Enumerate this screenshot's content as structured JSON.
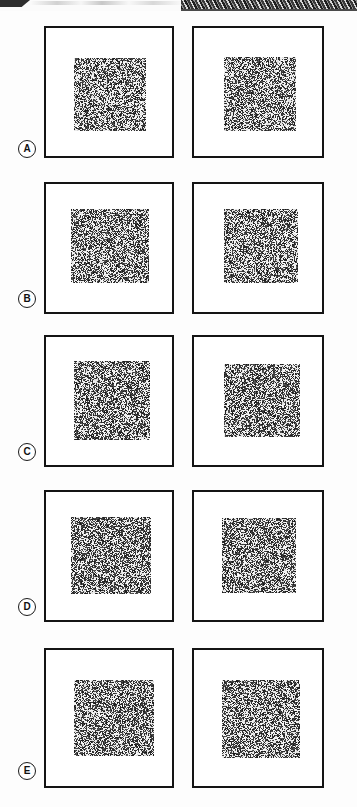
{
  "figure": {
    "width_px": 357,
    "height_px": 807,
    "background_color": "#fdfdfd",
    "panel_border_color": "#141414",
    "label_text_color": "#111111",
    "noise_dark_color": "#151515",
    "noise_light_color": "#ffffff",
    "columns": 2,
    "rows_count": 5
  },
  "scan_artifact": {
    "present": true,
    "description": "dark scan edge strip across top of page",
    "left_block_color": "#2e2e2e",
    "hatch_color": "#1f1f1f",
    "height_px": 11
  },
  "rows": [
    {
      "label": "A",
      "label_top": 140,
      "row_top": 24,
      "row_height": 136,
      "panels": [
        {
          "name": "panel-a-left",
          "left": 44,
          "top": 26,
          "width": 130,
          "height": 132,
          "patch": {
            "left": 28,
            "top": 30,
            "width": 72,
            "height": 73,
            "density": 0.5,
            "seed": 11
          }
        },
        {
          "name": "panel-a-right",
          "left": 192,
          "top": 26,
          "width": 132,
          "height": 132,
          "patch": {
            "left": 30,
            "top": 29,
            "width": 72,
            "height": 74,
            "density": 0.5,
            "seed": 12
          }
        }
      ]
    },
    {
      "label": "B",
      "label_top": 290,
      "row_top": 182,
      "row_height": 132,
      "panels": [
        {
          "name": "panel-b-left",
          "left": 44,
          "top": 182,
          "width": 130,
          "height": 132,
          "patch": {
            "left": 25,
            "top": 25,
            "width": 78,
            "height": 74,
            "density": 0.52,
            "seed": 21
          }
        },
        {
          "name": "panel-b-right",
          "left": 192,
          "top": 182,
          "width": 132,
          "height": 132,
          "patch": {
            "left": 30,
            "top": 25,
            "width": 74,
            "height": 74,
            "density": 0.52,
            "seed": 22
          }
        }
      ]
    },
    {
      "label": "C",
      "label_top": 443,
      "row_top": 335,
      "row_height": 132,
      "panels": [
        {
          "name": "panel-c-left",
          "left": 44,
          "top": 335,
          "width": 130,
          "height": 132,
          "patch": {
            "left": 28,
            "top": 24,
            "width": 76,
            "height": 79,
            "density": 0.54,
            "seed": 31
          }
        },
        {
          "name": "panel-c-right",
          "left": 192,
          "top": 335,
          "width": 132,
          "height": 132,
          "patch": {
            "left": 30,
            "top": 27,
            "width": 76,
            "height": 73,
            "density": 0.54,
            "seed": 32
          }
        }
      ]
    },
    {
      "label": "D",
      "label_top": 598,
      "row_top": 490,
      "row_height": 132,
      "panels": [
        {
          "name": "panel-d-left",
          "left": 44,
          "top": 490,
          "width": 130,
          "height": 132,
          "patch": {
            "left": 25,
            "top": 25,
            "width": 80,
            "height": 77,
            "density": 0.55,
            "seed": 41
          }
        },
        {
          "name": "panel-d-right",
          "left": 192,
          "top": 490,
          "width": 132,
          "height": 132,
          "patch": {
            "left": 28,
            "top": 26,
            "width": 74,
            "height": 75,
            "density": 0.55,
            "seed": 42
          }
        }
      ]
    },
    {
      "label": "E",
      "label_top": 762,
      "row_top": 648,
      "row_height": 140,
      "panels": [
        {
          "name": "panel-e-left",
          "left": 44,
          "top": 648,
          "width": 130,
          "height": 140,
          "patch": {
            "left": 28,
            "top": 30,
            "width": 80,
            "height": 76,
            "density": 0.53,
            "seed": 51
          }
        },
        {
          "name": "panel-e-right",
          "left": 192,
          "top": 648,
          "width": 132,
          "height": 140,
          "patch": {
            "left": 28,
            "top": 30,
            "width": 78,
            "height": 78,
            "density": 0.53,
            "seed": 52
          }
        }
      ]
    }
  ]
}
